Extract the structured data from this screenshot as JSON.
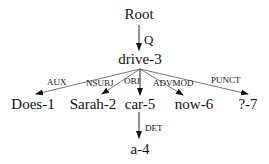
{
  "diagram": {
    "type": "dependency-tree",
    "nodes": {
      "root": "Root",
      "drive": "drive-3",
      "does": "Does-1",
      "sarah": "Sarah-2",
      "car": "car-5",
      "now": "now-6",
      "punct": "?-7",
      "a": "a-4"
    },
    "edges": {
      "q": "Q",
      "aux": "AUX",
      "nsubj": "NSUBJ",
      "obj": "OBJ",
      "advmod": "ADVMOD",
      "punct": "PUNCT",
      "det": "DET"
    },
    "edge_list": [
      {
        "from": "Root",
        "to": "drive-3",
        "label": "Q"
      },
      {
        "from": "drive-3",
        "to": "Does-1",
        "label": "AUX"
      },
      {
        "from": "drive-3",
        "to": "Sarah-2",
        "label": "NSUBJ"
      },
      {
        "from": "drive-3",
        "to": "car-5",
        "label": "OBJ"
      },
      {
        "from": "drive-3",
        "to": "now-6",
        "label": "ADVMOD"
      },
      {
        "from": "drive-3",
        "to": "?-7",
        "label": "PUNCT"
      },
      {
        "from": "car-5",
        "to": "a-4",
        "label": "DET"
      }
    ]
  }
}
